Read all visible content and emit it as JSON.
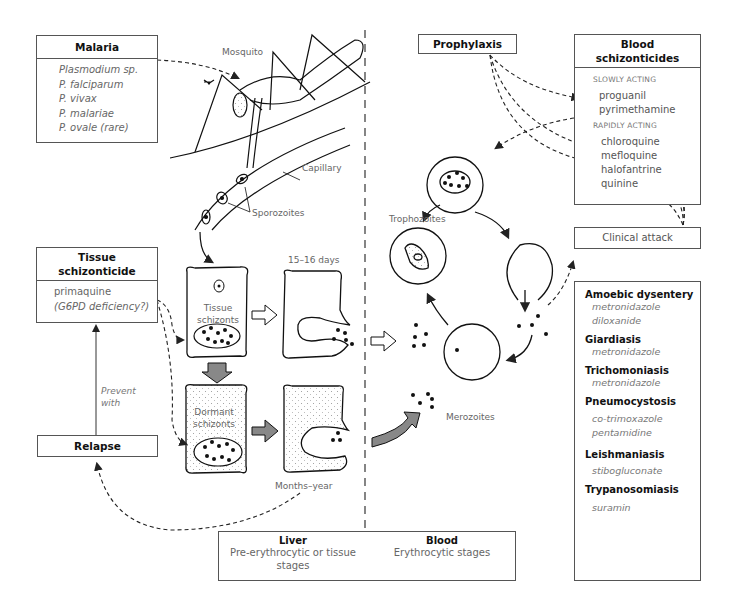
{
  "malaria": {
    "title": "Malaria",
    "species": [
      "Plasmodium sp.",
      "P. falciparum",
      "P. vivax",
      "P. malariae",
      "P. ovale (rare)"
    ]
  },
  "labels": {
    "mosquito": "Mosquito",
    "capillary": "Capillary",
    "sporozoites": "Sporozoites",
    "days": "15–16 days",
    "months": "Months–year",
    "tissue_schizonts": [
      "Tissue",
      "schizonts"
    ],
    "dormant_schizonts": [
      "Dormant",
      "schizonts"
    ],
    "trophozoites": "Trophozoites",
    "merozoites": "Merozoites",
    "prevent_with": [
      "Prevent",
      "with"
    ]
  },
  "tissue_schizonticide": {
    "title": [
      "Tissue",
      "schizonticide"
    ],
    "drugs": [
      "primaquine",
      "(G6PD deficiency?)"
    ]
  },
  "relapse": {
    "title": "Relapse"
  },
  "prophylaxis": {
    "title": "Prophylaxis"
  },
  "blood_schizonticides": {
    "title": [
      "Blood",
      "schizonticides"
    ],
    "slow_label": "SLOWLY ACTING",
    "slow": [
      "proguanil",
      "pyrimethamine"
    ],
    "rapid_label": "RAPIDLY ACTING",
    "rapid": [
      "chloroquine",
      "mefloquine",
      "halofantrine",
      "quinine"
    ]
  },
  "clinical_attack": {
    "title": "Clinical attack"
  },
  "other_protozoa": [
    {
      "disease": "Amoebic dysentery",
      "drugs": [
        "metronidazole",
        "diloxanide"
      ]
    },
    {
      "disease": "Giardiasis",
      "drugs": [
        "metronidazole"
      ]
    },
    {
      "disease": "Trichomoniasis",
      "drugs": [
        "metronidazole"
      ]
    },
    {
      "disease": "Pneumocystosis",
      "drugs": [
        "co-trimoxazole",
        "pentamidine"
      ]
    },
    {
      "disease": "Leishmaniasis",
      "drugs": [
        "stibogluconate"
      ]
    },
    {
      "disease": "Trypanosomiasis",
      "drugs": [
        "suramin"
      ]
    }
  ],
  "legend": {
    "liver_title": "Liver",
    "liver_desc": [
      "Pre-erythrocytic or tissue",
      "stages"
    ],
    "blood_title": "Blood",
    "blood_desc": "Erythrocytic stages"
  }
}
